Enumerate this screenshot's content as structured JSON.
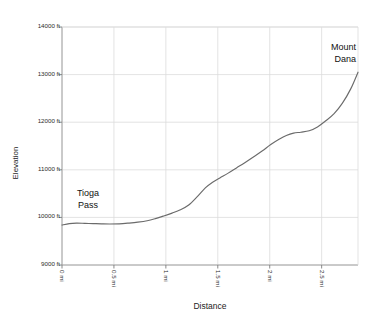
{
  "chart_data": {
    "type": "line",
    "title": "",
    "subtitle": "",
    "xlabel": "Distance",
    "ylabel": "Elevation",
    "xlim": [
      0,
      2.85
    ],
    "ylim": [
      9000,
      14000
    ],
    "grid": true,
    "legend": false,
    "legend_position": "none",
    "x_unit": "mi",
    "y_unit": "ft",
    "xticks": [
      0,
      0.5,
      1,
      1.5,
      2,
      2.5
    ],
    "xtick_labels": [
      "0 mi",
      "0.5 mi",
      "1 mi",
      "1.5 mi",
      "2 mi",
      "2.5 mi"
    ],
    "yticks": [
      9000,
      10000,
      11000,
      12000,
      13000,
      14000
    ],
    "ytick_labels": [
      "9000 ft",
      "10000 ft",
      "11000 ft",
      "12000 ft",
      "13000 ft",
      "14000 ft"
    ],
    "line_color": "#6b6b6b",
    "grid_color": "#dcdcdc",
    "axis_color": "#b4b4b4",
    "background": "#ffffff",
    "series": [
      {
        "name": "Elevation profile",
        "x": [
          0.0,
          0.07,
          0.14,
          0.22,
          0.3,
          0.38,
          0.46,
          0.55,
          0.64,
          0.73,
          0.82,
          0.9,
          0.98,
          1.06,
          1.14,
          1.22,
          1.3,
          1.38,
          1.45,
          1.52,
          1.6,
          1.68,
          1.76,
          1.85,
          1.93,
          2.01,
          2.09,
          2.16,
          2.23,
          2.3,
          2.38,
          2.46,
          2.54,
          2.62,
          2.7,
          2.78,
          2.85
        ],
        "y": [
          9840,
          9870,
          9880,
          9875,
          9870,
          9865,
          9862,
          9865,
          9880,
          9900,
          9930,
          9975,
          10030,
          10090,
          10160,
          10260,
          10430,
          10620,
          10740,
          10830,
          10930,
          11040,
          11150,
          11280,
          11400,
          11530,
          11640,
          11720,
          11770,
          11790,
          11820,
          11900,
          12030,
          12180,
          12400,
          12700,
          13050
        ]
      }
    ],
    "annotations": [
      {
        "id": "tioga-pass",
        "lines": [
          "Tioga",
          "Pass"
        ],
        "at_x": 0.1,
        "at_y": 9870
      },
      {
        "id": "mount-dana",
        "lines": [
          "Mount",
          "Dana"
        ],
        "at_x": 2.85,
        "at_y": 13050
      }
    ]
  }
}
